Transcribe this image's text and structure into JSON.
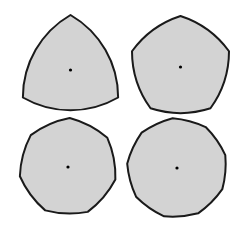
{
  "figure": {
    "colors": {
      "fill": "#d3d3d3",
      "stroke": "#1a1a1a",
      "center_dot": "#000000",
      "background": "#ffffff"
    },
    "stroke_width": 2,
    "center_dot_radius": 1.6,
    "shapes": [
      {
        "name": "reuleaux-triangle",
        "sides": 3,
        "cx": 70.5,
        "cy": 70,
        "R": 55,
        "rotation_deg": -90
      },
      {
        "name": "reuleaux-pentagon",
        "sides": 5,
        "cx": 180.5,
        "cy": 67,
        "R": 51,
        "rotation_deg": -90
      },
      {
        "name": "reuleaux-heptagon",
        "sides": 7,
        "cx": 68,
        "cy": 167,
        "R": 49,
        "rotation_deg": -88
      },
      {
        "name": "reuleaux-nonagon",
        "sides": 9,
        "cx": 177,
        "cy": 168,
        "R": 50,
        "rotation_deg": -95
      }
    ]
  }
}
